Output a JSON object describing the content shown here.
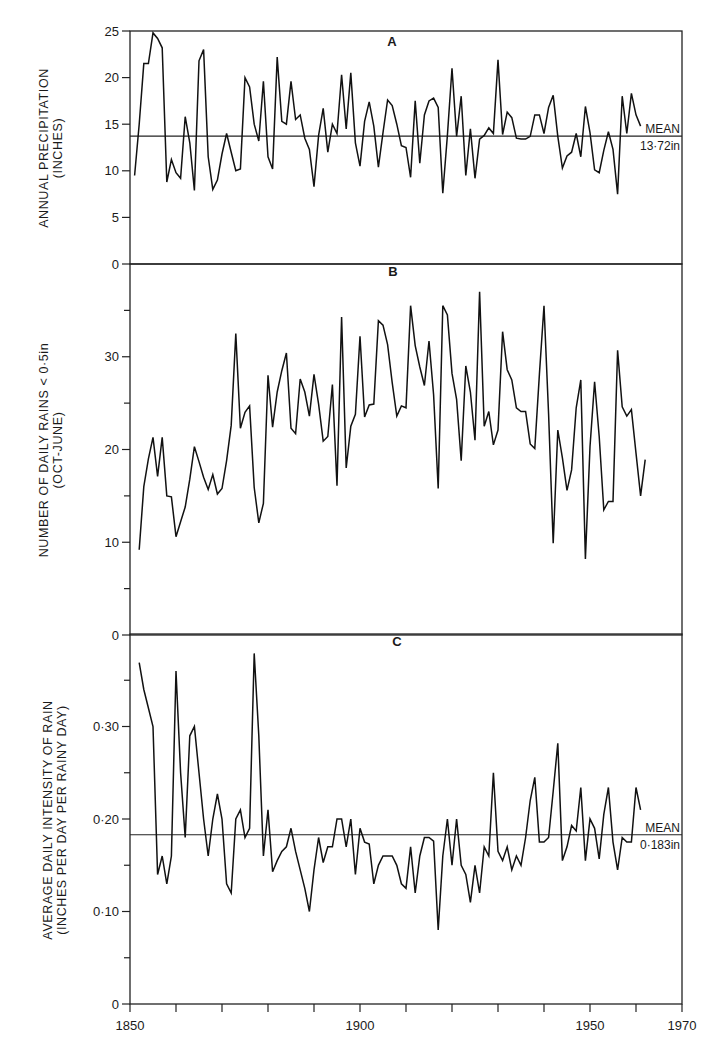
{
  "figure": {
    "x_axis": {
      "min": 1850,
      "max": 1970,
      "tick_step": 10,
      "tick_labels": [
        {
          "value": 1850,
          "label": "1850"
        },
        {
          "value": 1900,
          "label": "1900"
        },
        {
          "value": 1950,
          "label": "1950"
        },
        {
          "value": 1970,
          "label": "1970"
        }
      ]
    }
  },
  "chart_data": [
    {
      "panel": "A",
      "type": "line",
      "title": "A",
      "ylabel": "ANNUAL PRECIPITATION",
      "ylabel_sub": "(INCHES)",
      "xlabel": "",
      "ylim": [
        0,
        25
      ],
      "yticks": [
        {
          "value": 0,
          "label": "0"
        },
        {
          "value": 5,
          "label": "5"
        },
        {
          "value": 10,
          "label": "10"
        },
        {
          "value": 15,
          "label": "15"
        },
        {
          "value": 20,
          "label": "20"
        },
        {
          "value": 25,
          "label": "25"
        }
      ],
      "minor_yticks": [],
      "mean": {
        "value": 13.72,
        "label_top": "MEAN",
        "label_bottom": "13·72in"
      },
      "grid": false,
      "start_year": 1851,
      "values": [
        9.5,
        15,
        21.5,
        21.5,
        24.8,
        24.2,
        23.2,
        8.8,
        11.2,
        9.8,
        9.2,
        15.8,
        13,
        7.9,
        21.8,
        23,
        11.5,
        8,
        9,
        11.8,
        14,
        12,
        10,
        10.2,
        20,
        19,
        15,
        13.2,
        19.6,
        11.5,
        10.2,
        22.2,
        15.3,
        15,
        19.6,
        15.5,
        16,
        13.5,
        12.3,
        8.3,
        13.8,
        16.7,
        12,
        15,
        14,
        20.3,
        14.5,
        20.5,
        13,
        10.5,
        15.3,
        17.4,
        14.8,
        10.4,
        14.1,
        17.6,
        17,
        15,
        12.7,
        12.5,
        9.3,
        17.5,
        10.8,
        16,
        17.5,
        17.8,
        16.8,
        7.6,
        13.8,
        21,
        13.7,
        18,
        9.5,
        14.5,
        9.2,
        13.4,
        13.8,
        14.6,
        14,
        21.9,
        13.9,
        16.3,
        15.7,
        13.5,
        13.4,
        13.4,
        13.7,
        16,
        16,
        14,
        16.8,
        18.1,
        13.7,
        10.3,
        11.6,
        12,
        14,
        11.5,
        16.9,
        14.1,
        10.1,
        9.8,
        12.2,
        14.2,
        12.3,
        7.5,
        18,
        14,
        18.3,
        16,
        14.8
      ]
    },
    {
      "panel": "B",
      "type": "line",
      "title": "B",
      "ylabel": "NUMBER OF DAILY RAINS < 0·5in",
      "ylabel_sub": "(OCT-JUNE)",
      "xlabel": "",
      "ylim": [
        0,
        40
      ],
      "yticks": [
        {
          "value": 0,
          "label": "0"
        },
        {
          "value": 10,
          "label": "10"
        },
        {
          "value": 20,
          "label": "20"
        },
        {
          "value": 30,
          "label": "30"
        }
      ],
      "minor_yticks": [
        5,
        15,
        25,
        35
      ],
      "mean": null,
      "grid": false,
      "start_year": 1852,
      "values": [
        9.2,
        16,
        19,
        21.3,
        17.1,
        21.3,
        15,
        14.9,
        10.6,
        12.2,
        13.8,
        16.8,
        20.3,
        18.7,
        17,
        15.7,
        17.3,
        15.2,
        15.8,
        18.8,
        22.6,
        32.5,
        22.3,
        24,
        24.7,
        15.9,
        12.1,
        14.2,
        28,
        22.4,
        26.2,
        28.5,
        30.4,
        22.3,
        21.7,
        27.6,
        26.2,
        23.6,
        28.1,
        24.9,
        20.9,
        21.4,
        27,
        16.1,
        34.3,
        18,
        22.5,
        23.8,
        32.2,
        23.5,
        24.8,
        24.9,
        33.9,
        33.4,
        31.3,
        27.2,
        23.6,
        24.7,
        24.5,
        35.5,
        31.2,
        28.9,
        26.9,
        31.7,
        25.9,
        15.8,
        35.5,
        34.5,
        28.2,
        25.4,
        18.8,
        29,
        26.2,
        21,
        37,
        22.5,
        24.1,
        20.5,
        22.1,
        32.7,
        28.6,
        27.5,
        24.5,
        24.1,
        24.1,
        20.6,
        20.1,
        28.1,
        35.5,
        23.8,
        9.9,
        22.1,
        19.1,
        15.6,
        17.8,
        24.5,
        27.5,
        8.2,
        20.3,
        27.3,
        21.4,
        13.5,
        14.4,
        14.4,
        30.7,
        24.6,
        23.6,
        24.3,
        19.6,
        15,
        18.9
      ]
    },
    {
      "panel": "C",
      "type": "line",
      "title": "C",
      "ylabel": "AVERAGE DAILY INTENSITY OF RAIN",
      "ylabel_sub": "(INCHES PER DAY PER RAINY DAY)",
      "xlabel": "",
      "ylim": [
        0,
        0.4
      ],
      "yticks": [
        {
          "value": 0,
          "label": "0"
        },
        {
          "value": 0.1,
          "label": "0·10"
        },
        {
          "value": 0.2,
          "label": "0·20"
        },
        {
          "value": 0.3,
          "label": "0·30"
        }
      ],
      "minor_yticks": [
        0.05,
        0.15,
        0.25,
        0.35
      ],
      "mean": {
        "value": 0.183,
        "label_top": "MEAN",
        "label_bottom": "0·183in"
      },
      "grid": false,
      "start_year": 1852,
      "values": [
        0.369,
        0.34,
        0.32,
        0.3,
        0.14,
        0.16,
        0.13,
        0.16,
        0.36,
        0.25,
        0.18,
        0.29,
        0.3,
        0.25,
        0.2,
        0.16,
        0.2,
        0.227,
        0.2,
        0.13,
        0.12,
        0.2,
        0.21,
        0.18,
        0.19,
        0.379,
        0.29,
        0.16,
        0.21,
        0.143,
        0.155,
        0.165,
        0.17,
        0.19,
        0.165,
        0.145,
        0.125,
        0.1,
        0.145,
        0.18,
        0.153,
        0.17,
        0.17,
        0.2,
        0.2,
        0.17,
        0.2,
        0.14,
        0.19,
        0.175,
        0.173,
        0.13,
        0.15,
        0.16,
        0.16,
        0.16,
        0.15,
        0.13,
        0.125,
        0.17,
        0.12,
        0.16,
        0.18,
        0.18,
        0.176,
        0.08,
        0.16,
        0.2,
        0.15,
        0.2,
        0.15,
        0.14,
        0.11,
        0.15,
        0.12,
        0.17,
        0.16,
        0.25,
        0.165,
        0.155,
        0.17,
        0.145,
        0.16,
        0.15,
        0.18,
        0.22,
        0.245,
        0.175,
        0.175,
        0.18,
        0.23,
        0.282,
        0.155,
        0.17,
        0.193,
        0.187,
        0.234,
        0.155,
        0.2,
        0.19,
        0.157,
        0.205,
        0.234,
        0.175,
        0.145,
        0.18,
        0.175,
        0.175,
        0.234,
        0.21
      ]
    }
  ]
}
